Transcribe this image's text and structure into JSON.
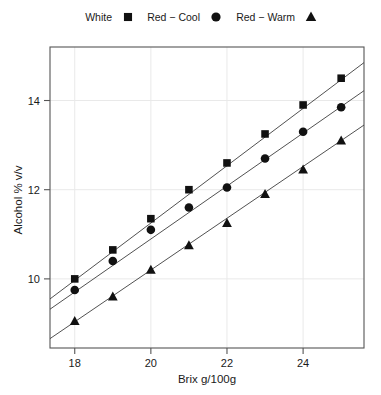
{
  "chart_data": {
    "type": "scatter",
    "title": "",
    "xlabel": "Brix g/100g",
    "ylabel": "Alcohol % v/v",
    "xlim": [
      17.35,
      25.6
    ],
    "ylim": [
      8.45,
      15.2
    ],
    "xticks": [
      18,
      20,
      22,
      24
    ],
    "yticks": [
      10,
      12,
      14
    ],
    "xtick_labels": [
      "18",
      "20",
      "22",
      "24"
    ],
    "ytick_labels": [
      "10",
      "12",
      "14"
    ],
    "grid": true,
    "legend_position": "top",
    "x": [
      18,
      19,
      20,
      21,
      22,
      23,
      24,
      25
    ],
    "series": [
      {
        "name": "White",
        "marker": "square",
        "values": [
          10.0,
          10.65,
          11.35,
          12.0,
          12.6,
          13.25,
          13.9,
          14.5
        ],
        "fit": {
          "x0": 17.35,
          "y0": 9.55,
          "x1": 25.6,
          "y1": 14.85
        }
      },
      {
        "name": "Red − Cool",
        "marker": "circle",
        "values": [
          9.75,
          10.4,
          11.1,
          11.6,
          12.05,
          12.7,
          13.3,
          13.85
        ],
        "fit": {
          "x0": 17.35,
          "y0": 9.32,
          "x1": 25.6,
          "y1": 14.22
        }
      },
      {
        "name": "Red − Warm",
        "marker": "triangle",
        "values": [
          9.05,
          9.6,
          10.2,
          10.75,
          11.25,
          11.9,
          12.45,
          13.1
        ],
        "fit": {
          "x0": 17.35,
          "y0": 8.66,
          "x1": 25.6,
          "y1": 13.45
        }
      }
    ]
  },
  "legend": {
    "items": [
      {
        "label": "White",
        "marker": "square"
      },
      {
        "label": "Red − Cool",
        "marker": "circle"
      },
      {
        "label": "Red − Warm",
        "marker": "triangle"
      }
    ]
  },
  "colors": {
    "marker": "#111111",
    "line": "#3d3d3d",
    "frame": "#555555",
    "grid": "#e9e9e9",
    "text": "#1a1a1a",
    "background": "#ffffff"
  }
}
